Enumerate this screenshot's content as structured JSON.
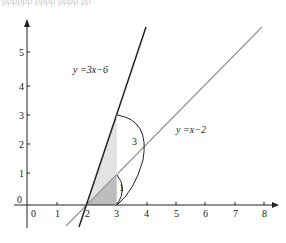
{
  "header_cut_text": "ββββββ ββββ ββββ ββ",
  "axes": {
    "x_ticks": [
      "0",
      "1",
      "2",
      "3",
      "4",
      "5",
      "6",
      "7",
      "8"
    ],
    "y_ticks": [
      "1",
      "2",
      "3",
      "4",
      "5"
    ],
    "origin_y_label": "0"
  },
  "lines": [
    {
      "name": "steep",
      "label_y": "y",
      "label_eq": " =3x−6",
      "color": "#222222",
      "slope": 3,
      "intercept": -6
    },
    {
      "name": "shallow",
      "label_y": "y",
      "label_eq": " =x−2",
      "color": "#999999",
      "slope": 1,
      "intercept": -2
    }
  ],
  "annotations": {
    "arc_big_label": "3",
    "arc_small_label": "1"
  },
  "colors": {
    "shade_light": "#e3e3e3",
    "shade_dark": "#bdbdbd",
    "axis": "#222222"
  }
}
